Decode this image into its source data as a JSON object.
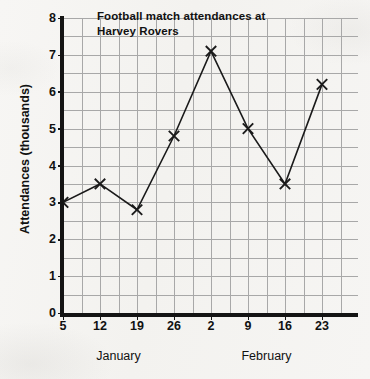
{
  "chart_data": {
    "type": "line",
    "title": "Football match attendances at Harvey Rovers",
    "title_lines": [
      "Football match attendances at",
      "Harvey Rovers"
    ],
    "xlabel": "",
    "ylabel": "Attendances (thousands)",
    "categories": [
      "5",
      "12",
      "19",
      "26",
      "2",
      "9",
      "16",
      "23"
    ],
    "values": [
      3.0,
      3.5,
      2.8,
      4.8,
      7.1,
      5.0,
      3.5,
      6.2
    ],
    "x": [
      5,
      12,
      19,
      26,
      2,
      9,
      16,
      23
    ],
    "groups": [
      {
        "label": "January",
        "categories": [
          "5",
          "12",
          "19",
          "26"
        ]
      },
      {
        "label": "February",
        "categories": [
          "2",
          "9",
          "16",
          "23"
        ]
      }
    ],
    "ylim": [
      0,
      8
    ],
    "yticks": [
      "0",
      "1",
      "2",
      "3",
      "4",
      "5",
      "6",
      "7",
      "8"
    ],
    "y_minor_step": 0.5,
    "grid": true,
    "legend": "none",
    "marker": "x",
    "line_color": "#1a1a1a",
    "grid_color": "#a8a8a8",
    "axis_color": "#141414",
    "background": "#f5f4f2"
  },
  "axes": {
    "x_positions": [
      63,
      100,
      137,
      174,
      211,
      248,
      285,
      322
    ],
    "x_minor_count": 16,
    "plot_left": 63,
    "plot_right": 358,
    "plot_top": 18,
    "plot_bottom": 313
  }
}
